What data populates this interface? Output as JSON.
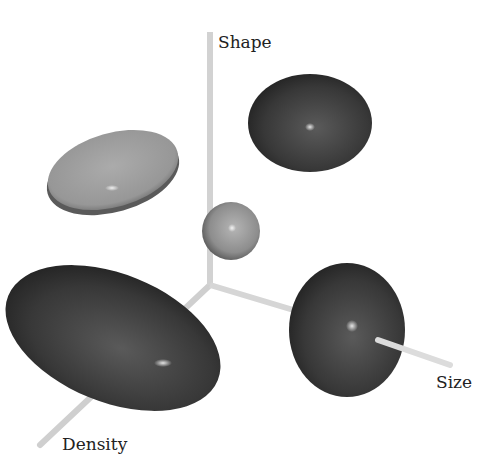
{
  "diagram": {
    "axes": {
      "vertical": {
        "label": "Shape"
      },
      "right": {
        "label": "Size"
      },
      "front": {
        "label": "Density"
      }
    },
    "shapes": [
      {
        "name": "center-sphere",
        "shade": "medium-gray",
        "form": "sphere"
      },
      {
        "name": "shape-ellipsoid",
        "shade": "dark-gray",
        "form": "oblate ellipsoid"
      },
      {
        "name": "flat-disc-ellipsoid",
        "shade": "light-gray",
        "form": "flattened disc"
      },
      {
        "name": "density-ellipsoid",
        "shade": "dark-gray",
        "form": "elongated ellipsoid"
      },
      {
        "name": "size-sphere",
        "shade": "dark-gray",
        "form": "large sphere"
      }
    ],
    "colors": {
      "axis": "#d8d8d8",
      "dark": "#3a3a3a",
      "light": "#9a9a9a",
      "center": "#8a8a8a"
    }
  }
}
